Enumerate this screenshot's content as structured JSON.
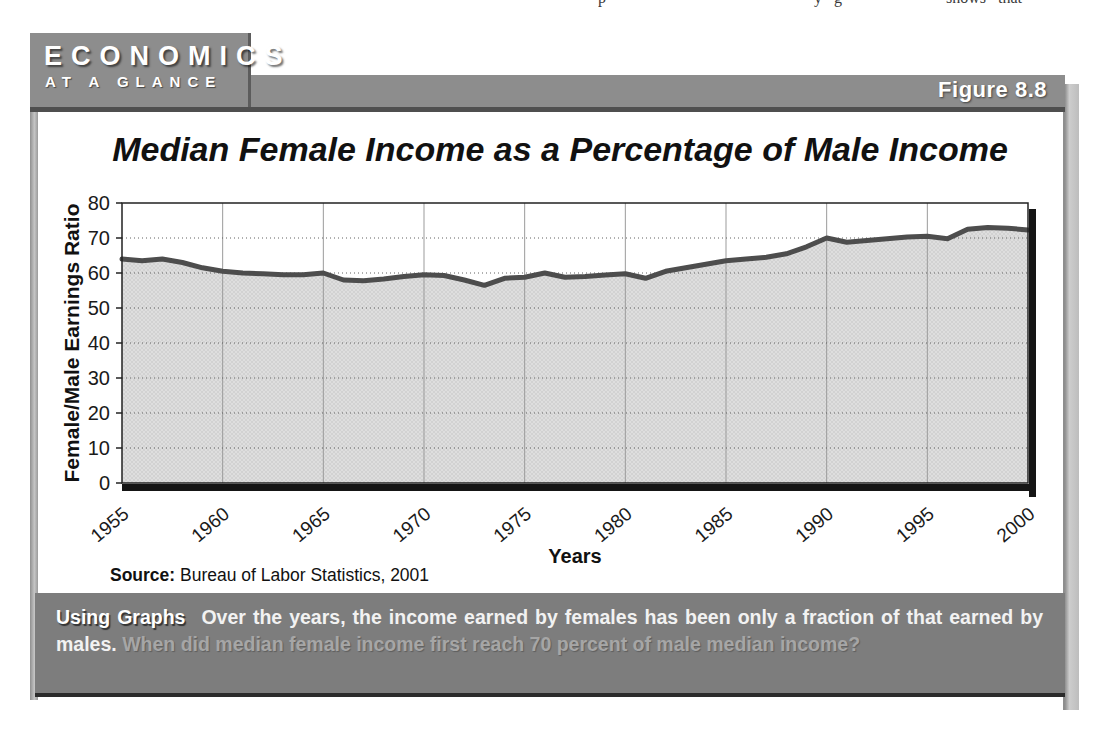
{
  "page_top_fragment": "p                                                    y   g                          shows   that",
  "header": {
    "kicker_line1": "ECONOMICS",
    "kicker_line2": "AT A GLANCE",
    "figure_label": "Figure 8.8"
  },
  "chart_data": {
    "type": "area",
    "title": "Median Female Income as a Percentage of Male Income",
    "xlabel": "Years",
    "ylabel": "Female/Male Earnings Ratio",
    "source_label": "Source:",
    "source_text": " Bureau of Labor Statistics, 2001",
    "xlim": [
      1955,
      2000
    ],
    "ylim": [
      0,
      80
    ],
    "xticks": [
      1955,
      1960,
      1965,
      1970,
      1975,
      1980,
      1985,
      1990,
      1995,
      2000
    ],
    "yticks": [
      0,
      10,
      20,
      30,
      40,
      50,
      60,
      70,
      80
    ],
    "grid": {
      "horizontal": "dotted",
      "vertical": "solid"
    },
    "legend": "none",
    "x": [
      1955,
      1956,
      1957,
      1958,
      1959,
      1960,
      1961,
      1962,
      1963,
      1964,
      1965,
      1966,
      1967,
      1968,
      1969,
      1970,
      1971,
      1972,
      1973,
      1974,
      1975,
      1976,
      1977,
      1978,
      1979,
      1980,
      1981,
      1982,
      1983,
      1984,
      1985,
      1986,
      1987,
      1988,
      1989,
      1990,
      1991,
      1992,
      1993,
      1994,
      1995,
      1996,
      1997,
      1998,
      1999,
      2000
    ],
    "values": [
      64.0,
      63.5,
      64.0,
      63.0,
      61.5,
      60.5,
      60.0,
      59.8,
      59.5,
      59.5,
      60.0,
      58.0,
      57.8,
      58.3,
      59.0,
      59.5,
      59.3,
      58.0,
      56.5,
      58.5,
      58.8,
      60.0,
      58.8,
      59.0,
      59.4,
      59.8,
      58.5,
      60.5,
      61.5,
      62.5,
      63.5,
      64.0,
      64.5,
      65.5,
      67.5,
      70.0,
      68.8,
      69.3,
      69.8,
      70.3,
      70.5,
      69.8,
      72.5,
      73.0,
      72.8,
      72.3
    ],
    "line_color": "#4d4d4d",
    "fill_color": "#dedede"
  },
  "caption": {
    "lead": "Using Graphs",
    "statement": "Over the years, the income earned by females has been only a fraction of that earned by males.",
    "question": "When did median female income first reach 70 percent of male median income?"
  },
  "colors": {
    "chrome_gray": "#8d8d8d",
    "band_gray": "#7d7d7d",
    "shadow_dark": "#2b2b2b",
    "grid_gray": "#9b9b9b"
  }
}
